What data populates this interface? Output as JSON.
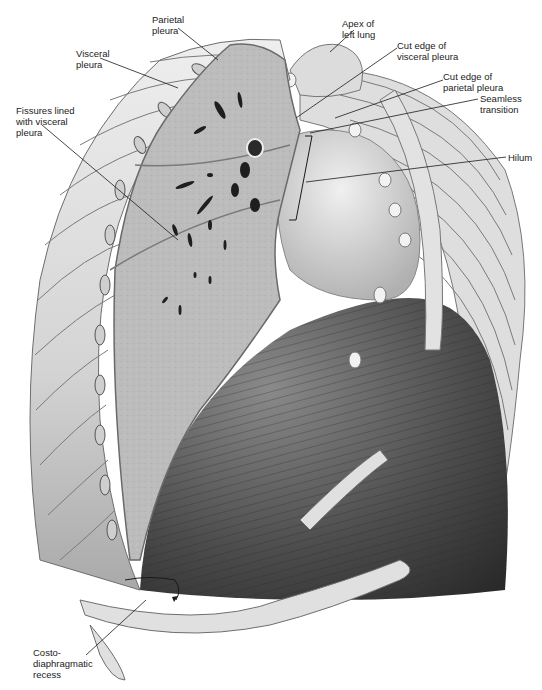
{
  "diagram": {
    "colors": {
      "background": "#ffffff",
      "lung_tissue": "#b9b9b9",
      "rib": "#d9d9d9",
      "rib_outline": "#6e6e6e",
      "diaphragm_dark": "#3a3a3a",
      "heart": "#d2d2d2",
      "text": "#222222",
      "leader": "#1a1a1a"
    },
    "labels": [
      {
        "id": "parietal-pleura",
        "text": "Parietal\npleura",
        "x": 152,
        "y": 14,
        "line": [
          [
            178,
            28
          ],
          [
            218,
            60
          ]
        ]
      },
      {
        "id": "apex-left-lung",
        "text": "Apex of\nleft lung",
        "x": 342,
        "y": 18,
        "line": [
          [
            354,
            30
          ],
          [
            330,
            52
          ]
        ]
      },
      {
        "id": "visceral-pleura",
        "text": "Visceral\npleura",
        "x": 76,
        "y": 48,
        "line": [
          [
            100,
            58
          ],
          [
            178,
            88
          ]
        ]
      },
      {
        "id": "cut-edge-visceral-pleura",
        "text": "Cut edge of\nvisceral pleura",
        "x": 397,
        "y": 40,
        "line": [
          [
            397,
            48
          ],
          [
            296,
            118
          ]
        ]
      },
      {
        "id": "cut-edge-parietal-pleura",
        "text": "Cut edge of\nparietal pleura",
        "x": 443,
        "y": 71,
        "line": [
          [
            443,
            80
          ],
          [
            335,
            118
          ]
        ]
      },
      {
        "id": "seamless-transition",
        "text": "Seamless\ntransition",
        "x": 480,
        "y": 93,
        "line": [
          [
            478,
            99
          ],
          [
            310,
            133
          ]
        ]
      },
      {
        "id": "fissures-visceral-pleura",
        "text": "Fissures lined\nwith visceral\npleura",
        "x": 16,
        "y": 105,
        "line": [
          [
            42,
            125
          ],
          [
            178,
            240
          ]
        ]
      },
      {
        "id": "hilum",
        "text": "Hilum",
        "x": 508,
        "y": 152,
        "line": [
          [
            506,
            157
          ],
          [
            306,
            182
          ]
        ]
      },
      {
        "id": "costo-diaphragmatic-recess",
        "text": "Costo-\ndiaphragmatic\nrecess",
        "x": 33,
        "y": 647,
        "line": [
          [
            86,
            655
          ],
          [
            146,
            600
          ]
        ]
      }
    ]
  }
}
